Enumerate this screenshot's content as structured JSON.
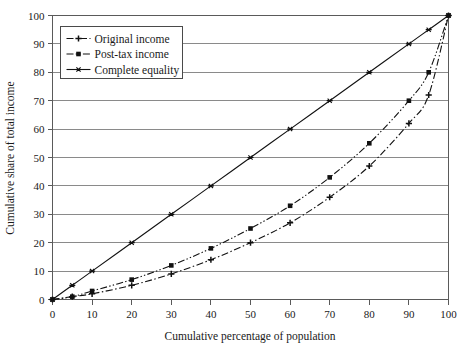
{
  "chart_data": {
    "type": "line",
    "title": "",
    "xlabel": "Cumulative percentage of population",
    "ylabel": "Cumulative share of total income",
    "xlim": [
      0,
      100
    ],
    "ylim": [
      0,
      100
    ],
    "xticks": [
      0,
      10,
      20,
      30,
      40,
      50,
      60,
      70,
      80,
      90,
      100
    ],
    "yticks": [
      0,
      10,
      20,
      30,
      40,
      50,
      60,
      70,
      80,
      90,
      100
    ],
    "xtick_labels": [
      "0",
      "10",
      "20",
      "30",
      "40",
      "50",
      "60",
      "70",
      "80",
      "90",
      "100"
    ],
    "ytick_labels": [
      "0",
      "10",
      "20",
      "30",
      "40",
      "50",
      "60",
      "70",
      "80",
      "90",
      "100"
    ],
    "grid": "horizontal",
    "legend_position": "top-left",
    "series": [
      {
        "name": "Original income",
        "legend_marker": "plus",
        "line_style": "dash-dot",
        "x": [
          0,
          5,
          10,
          20,
          30,
          40,
          50,
          60,
          70,
          80,
          90,
          95,
          100
        ],
        "values": [
          0,
          1,
          2,
          5,
          9,
          14,
          20,
          27,
          36,
          47,
          62,
          72,
          100
        ]
      },
      {
        "name": "Post-tax income",
        "legend_marker": "square",
        "line_style": "dash-dot-dot",
        "x": [
          0,
          5,
          10,
          20,
          30,
          40,
          50,
          60,
          70,
          80,
          90,
          95,
          100
        ],
        "values": [
          0,
          1,
          3,
          7,
          12,
          18,
          25,
          33,
          43,
          55,
          70,
          80,
          100
        ]
      },
      {
        "name": "Complete equality",
        "legend_marker": "star",
        "line_style": "solid",
        "x": [
          0,
          5,
          10,
          20,
          30,
          40,
          50,
          60,
          70,
          80,
          90,
          95,
          100
        ],
        "values": [
          0,
          5,
          10,
          20,
          30,
          40,
          50,
          60,
          70,
          80,
          90,
          95,
          100
        ]
      }
    ]
  },
  "legend": {
    "items": [
      {
        "label": "Original income"
      },
      {
        "label": "Post-tax income"
      },
      {
        "label": "Complete equality"
      }
    ]
  },
  "colors": {
    "line": "#111111",
    "grid": "#8a8a8a",
    "frame": "#5a5a5a",
    "background": "#ffffff"
  }
}
